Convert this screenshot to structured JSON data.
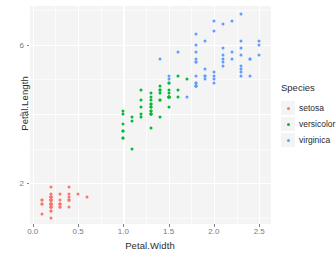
{
  "chart_data": {
    "type": "scatter",
    "title": "",
    "xlabel": "Petal.Width",
    "ylabel": "Petal.Length",
    "xlim": [
      -0.03,
      2.63
    ],
    "ylim": [
      0.82,
      7.12
    ],
    "xticks": [
      "0.0",
      "0.5",
      "1.0",
      "1.5",
      "2.0",
      "2.5"
    ],
    "xtick_values": [
      0.0,
      0.5,
      1.0,
      1.5,
      2.0,
      2.5
    ],
    "yticks": [
      "2",
      "4",
      "6"
    ],
    "ytick_values": [
      2,
      4,
      6
    ],
    "grid": true,
    "legend_position": "right",
    "legend_title": "Species",
    "panel_background": "#f4f4f4",
    "grid_color": "#ffffff",
    "series": [
      {
        "name": "setosa",
        "color": "#F8766D",
        "x": [
          0.2,
          0.2,
          0.2,
          0.2,
          0.2,
          0.4,
          0.3,
          0.2,
          0.2,
          0.1,
          0.2,
          0.2,
          0.1,
          0.1,
          0.2,
          0.4,
          0.4,
          0.3,
          0.3,
          0.3,
          0.2,
          0.4,
          0.2,
          0.5,
          0.2,
          0.2,
          0.4,
          0.2,
          0.2,
          0.2,
          0.2,
          0.4,
          0.1,
          0.2,
          0.2,
          0.2,
          0.2,
          0.1,
          0.2,
          0.2,
          0.3,
          0.3,
          0.2,
          0.6,
          0.4,
          0.3,
          0.2,
          0.2,
          0.2,
          0.2
        ],
        "y": [
          1.4,
          1.4,
          1.3,
          1.5,
          1.4,
          1.7,
          1.4,
          1.5,
          1.4,
          1.5,
          1.5,
          1.6,
          1.4,
          1.1,
          1.2,
          1.5,
          1.3,
          1.4,
          1.7,
          1.5,
          1.7,
          1.5,
          1.0,
          1.7,
          1.9,
          1.6,
          1.6,
          1.5,
          1.4,
          1.6,
          1.6,
          1.5,
          1.5,
          1.4,
          1.5,
          1.2,
          1.3,
          1.4,
          1.3,
          1.5,
          1.3,
          1.3,
          1.3,
          1.6,
          1.9,
          1.4,
          1.6,
          1.4,
          1.5,
          1.4
        ]
      },
      {
        "name": "versicolor",
        "color": "#00BA38",
        "x": [
          1.4,
          1.5,
          1.5,
          1.3,
          1.5,
          1.3,
          1.6,
          1.0,
          1.3,
          1.4,
          1.0,
          1.5,
          1.0,
          1.4,
          1.3,
          1.4,
          1.5,
          1.0,
          1.5,
          1.1,
          1.8,
          1.3,
          1.5,
          1.2,
          1.3,
          1.4,
          1.4,
          1.7,
          1.5,
          1.0,
          1.1,
          1.0,
          1.2,
          1.6,
          1.5,
          1.6,
          1.5,
          1.3,
          1.3,
          1.3,
          1.2,
          1.4,
          1.2,
          1.0,
          1.3,
          1.2,
          1.3,
          1.3,
          1.1,
          1.3
        ],
        "y": [
          4.7,
          4.5,
          4.9,
          4.0,
          4.6,
          4.5,
          4.7,
          3.3,
          4.6,
          3.9,
          3.5,
          4.2,
          4.0,
          4.7,
          3.6,
          4.4,
          4.5,
          4.1,
          4.5,
          3.9,
          4.8,
          4.0,
          4.9,
          4.7,
          4.3,
          4.4,
          4.8,
          5.0,
          4.5,
          3.5,
          3.8,
          3.7,
          3.9,
          5.1,
          4.5,
          4.5,
          4.7,
          4.4,
          4.1,
          4.0,
          4.4,
          4.6,
          4.0,
          3.3,
          4.2,
          4.2,
          4.2,
          4.3,
          3.0,
          4.1
        ]
      },
      {
        "name": "virginica",
        "color": "#619CFF",
        "x": [
          2.5,
          1.9,
          2.1,
          1.8,
          2.2,
          2.1,
          1.7,
          1.8,
          1.8,
          2.5,
          2.0,
          1.9,
          2.1,
          2.0,
          2.4,
          2.3,
          1.8,
          2.2,
          2.3,
          1.5,
          2.3,
          2.0,
          2.0,
          1.8,
          2.1,
          1.8,
          1.8,
          1.8,
          2.1,
          1.6,
          1.9,
          2.0,
          2.2,
          1.5,
          1.4,
          2.3,
          2.4,
          1.8,
          1.8,
          2.1,
          2.4,
          2.3,
          1.9,
          2.3,
          2.5,
          2.3,
          1.9,
          2.0,
          2.3,
          1.8
        ],
        "y": [
          6.0,
          5.1,
          5.9,
          5.6,
          5.8,
          6.6,
          4.5,
          6.3,
          5.8,
          6.1,
          5.1,
          5.3,
          5.5,
          5.0,
          5.1,
          5.3,
          5.5,
          6.7,
          6.9,
          5.0,
          5.7,
          4.9,
          6.7,
          4.9,
          5.7,
          6.0,
          4.8,
          4.9,
          5.6,
          5.8,
          6.1,
          6.4,
          5.6,
          5.1,
          5.6,
          6.1,
          5.6,
          5.5,
          4.8,
          5.4,
          5.6,
          5.1,
          5.1,
          5.9,
          5.7,
          5.2,
          5.0,
          5.2,
          5.4,
          5.1
        ]
      }
    ]
  },
  "legend": {
    "title": "Species",
    "items": [
      {
        "label": "setosa",
        "color": "#F8766D"
      },
      {
        "label": "versicolor",
        "color": "#00BA38"
      },
      {
        "label": "virginica",
        "color": "#619CFF"
      }
    ]
  }
}
